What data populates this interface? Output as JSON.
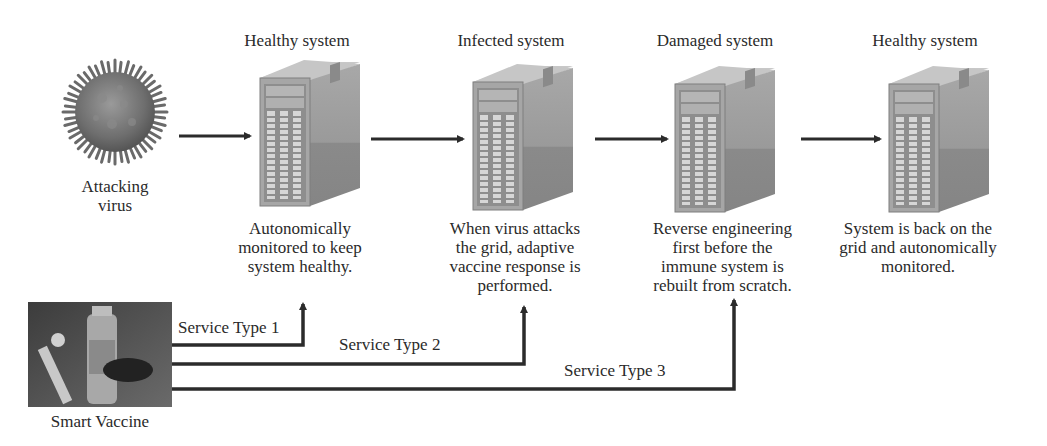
{
  "virus": {
    "label_line1": "Attacking",
    "label_line2": "virus",
    "icon": "virus-icon"
  },
  "stages": [
    {
      "title": "Healthy system",
      "icon": "server-icon",
      "caption_lines": [
        "Autonomically",
        "monitored to keep",
        "system healthy."
      ]
    },
    {
      "title": "Infected system",
      "icon": "server-icon",
      "caption_lines": [
        "When virus attacks",
        "the grid, adaptive",
        "vaccine response is",
        "performed."
      ]
    },
    {
      "title": "Damaged system",
      "icon": "server-icon",
      "caption_lines": [
        "Reverse engineering",
        "first before the",
        "immune system is",
        "rebuilt from scratch."
      ]
    },
    {
      "title": "Healthy system",
      "icon": "server-icon",
      "caption_lines": [
        "System is back on the",
        "grid and autonomically",
        "monitored."
      ]
    }
  ],
  "vaccine": {
    "label": "Smart Vaccine",
    "icon": "vaccine-vial-icon"
  },
  "service_types": [
    {
      "label": "Service Type 1",
      "target_stage": 0
    },
    {
      "label": "Service Type 2",
      "target_stage": 1
    },
    {
      "label": "Service Type 3",
      "target_stage": 2
    }
  ],
  "colors": {
    "arrow": "#2b2b2b",
    "server_front": "#a9a9a9",
    "server_side": "#8c8c8c",
    "server_top": "#c4c4c4",
    "text": "#2a2a2a"
  }
}
